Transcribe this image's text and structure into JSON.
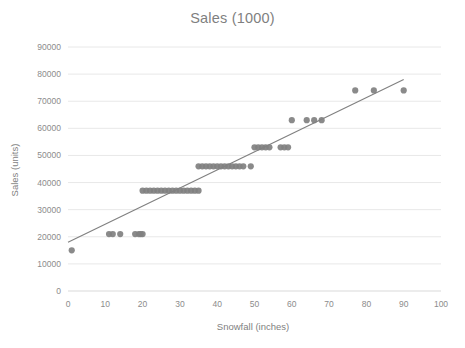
{
  "chart_data": {
    "type": "scatter",
    "title": "Sales (1000)",
    "xlabel": "Snowfall (inches)",
    "ylabel": "Sales (units)",
    "xlim": [
      0,
      100
    ],
    "ylim": [
      0,
      90000
    ],
    "xticks": [
      0,
      10,
      20,
      30,
      40,
      50,
      60,
      70,
      80,
      90,
      100
    ],
    "yticks": [
      0,
      10000,
      20000,
      30000,
      40000,
      50000,
      60000,
      70000,
      80000,
      90000
    ],
    "xtick_labels": [
      "0",
      "10",
      "20",
      "30",
      "40",
      "50",
      "60",
      "70",
      "80",
      "90",
      "100"
    ],
    "ytick_labels": [
      "0",
      "10000",
      "20000",
      "30000",
      "40000",
      "50000",
      "60000",
      "70000",
      "80000",
      "90000"
    ],
    "grid": {
      "horizontal": true,
      "vertical": false
    },
    "legend": null,
    "marker": {
      "shape": "circle",
      "color": "#808080",
      "size": 5
    },
    "series": [
      {
        "name": "Sales vs Snowfall",
        "points": [
          [
            1,
            15000
          ],
          [
            11,
            21000
          ],
          [
            12,
            21000
          ],
          [
            14,
            21000
          ],
          [
            18,
            21000
          ],
          [
            19,
            21000
          ],
          [
            19.5,
            21000
          ],
          [
            20,
            21000
          ],
          [
            20,
            37000
          ],
          [
            21,
            37000
          ],
          [
            22,
            37000
          ],
          [
            23,
            37000
          ],
          [
            24,
            37000
          ],
          [
            25,
            37000
          ],
          [
            26,
            37000
          ],
          [
            27,
            37000
          ],
          [
            28,
            37000
          ],
          [
            29,
            37000
          ],
          [
            30,
            37000
          ],
          [
            31,
            37000
          ],
          [
            32,
            37000
          ],
          [
            33,
            37000
          ],
          [
            34,
            37000
          ],
          [
            35,
            37000
          ],
          [
            35,
            46000
          ],
          [
            36,
            46000
          ],
          [
            37,
            46000
          ],
          [
            38,
            46000
          ],
          [
            39,
            46000
          ],
          [
            40,
            46000
          ],
          [
            41,
            46000
          ],
          [
            42,
            46000
          ],
          [
            43,
            46000
          ],
          [
            44,
            46000
          ],
          [
            45,
            46000
          ],
          [
            46,
            46000
          ],
          [
            47,
            46000
          ],
          [
            49,
            46000
          ],
          [
            50,
            53000
          ],
          [
            51,
            53000
          ],
          [
            52,
            53000
          ],
          [
            53,
            53000
          ],
          [
            54,
            53000
          ],
          [
            57,
            53000
          ],
          [
            58,
            53000
          ],
          [
            59,
            53000
          ],
          [
            60,
            63000
          ],
          [
            64,
            63000
          ],
          [
            66,
            63000
          ],
          [
            68,
            63000
          ],
          [
            77,
            74000
          ],
          [
            82,
            74000
          ],
          [
            90,
            74000
          ]
        ]
      }
    ],
    "trendline": {
      "type": "linear",
      "color": "#808080",
      "x_start": 0,
      "y_start": 18000,
      "x_end": 90,
      "y_end": 78000
    }
  },
  "colors": {
    "marker": "#808080",
    "trendline": "#808080",
    "gridline": "#e8e8e8",
    "text": "#7f7f7f",
    "tick_text": "#8c8c8c",
    "background": "#ffffff"
  }
}
